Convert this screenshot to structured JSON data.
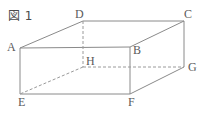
{
  "figure": {
    "caption": "図 1",
    "shape_name": "rectangular-cuboid",
    "projection": "oblique",
    "stroke_color": "#8a8a8a",
    "hidden_stroke_color": "#9a9a9a",
    "label_color": "#5a5a5a",
    "background_color": "#ffffff",
    "stroke_width": 1,
    "dash_pattern": "3,2"
  },
  "vertices": [
    {
      "id": "A",
      "label": "A",
      "x": 20,
      "y": 48,
      "label_x": 7,
      "label_y": 41,
      "hidden": false
    },
    {
      "id": "B",
      "label": "B",
      "x": 130,
      "y": 47,
      "label_x": 133,
      "label_y": 44,
      "hidden": false
    },
    {
      "id": "C",
      "label": "C",
      "x": 184,
      "y": 21,
      "label_x": 184,
      "label_y": 8,
      "hidden": false
    },
    {
      "id": "D",
      "label": "D",
      "x": 83,
      "y": 21,
      "label_x": 75,
      "label_y": 8,
      "hidden": false
    },
    {
      "id": "E",
      "label": "E",
      "x": 20,
      "y": 94,
      "label_x": 18,
      "label_y": 96,
      "hidden": false
    },
    {
      "id": "F",
      "label": "F",
      "x": 130,
      "y": 94,
      "label_x": 128,
      "label_y": 96,
      "hidden": false
    },
    {
      "id": "G",
      "label": "G",
      "x": 184,
      "y": 67,
      "label_x": 188,
      "label_y": 61,
      "hidden": false
    },
    {
      "id": "H",
      "label": "H",
      "x": 83,
      "y": 67,
      "label_x": 86,
      "label_y": 55,
      "hidden": true
    }
  ],
  "edges": [
    {
      "from": "A",
      "to": "D",
      "style": "solid"
    },
    {
      "from": "D",
      "to": "C",
      "style": "solid"
    },
    {
      "from": "C",
      "to": "B",
      "style": "solid"
    },
    {
      "from": "B",
      "to": "A",
      "style": "solid"
    },
    {
      "from": "A",
      "to": "E",
      "style": "solid"
    },
    {
      "from": "B",
      "to": "F",
      "style": "solid"
    },
    {
      "from": "C",
      "to": "G",
      "style": "solid"
    },
    {
      "from": "E",
      "to": "F",
      "style": "solid"
    },
    {
      "from": "F",
      "to": "G",
      "style": "solid"
    },
    {
      "from": "D",
      "to": "H",
      "style": "dashed"
    },
    {
      "from": "H",
      "to": "E",
      "style": "dashed"
    },
    {
      "from": "H",
      "to": "G",
      "style": "dashed"
    }
  ]
}
